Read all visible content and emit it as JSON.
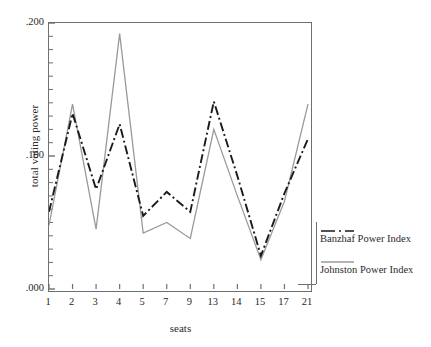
{
  "chart_data": {
    "type": "line",
    "title": "",
    "xlabel": "seats",
    "ylabel": "total voting power",
    "categories": [
      "1",
      "2",
      "3",
      "4",
      "5",
      "7",
      "9",
      "13",
      "14",
      "15",
      "17",
      "21"
    ],
    "xlim": [
      0,
      11
    ],
    "ylim": [
      0.0,
      0.2
    ],
    "yticks": [
      ".000",
      ".100",
      ".200"
    ],
    "ytick_values": [
      0.0,
      0.1,
      0.2
    ],
    "minor_ticks": true,
    "grid": false,
    "legend_position": "right",
    "series": [
      {
        "name": "Banzhaf Power Index",
        "style": "dash-dot",
        "color": "#1a1a1a",
        "values": [
          0.058,
          0.132,
          0.075,
          0.124,
          0.055,
          0.073,
          0.058,
          0.141,
          0.085,
          0.025,
          0.072,
          0.113
        ]
      },
      {
        "name": "Johnston Power Index",
        "style": "solid",
        "color": "#9a9a9a",
        "values": [
          0.048,
          0.139,
          0.045,
          0.192,
          0.042,
          0.05,
          0.038,
          0.12,
          0.07,
          0.022,
          0.066,
          0.139
        ]
      }
    ]
  },
  "axes": {
    "y_title": "total voting power",
    "x_title": "seats"
  },
  "legend": {
    "entries": [
      {
        "label": "Banzhaf Power Index",
        "icon": "dash-dot-line-icon"
      },
      {
        "label": "Johnston Power Index",
        "icon": "solid-line-icon"
      }
    ]
  }
}
